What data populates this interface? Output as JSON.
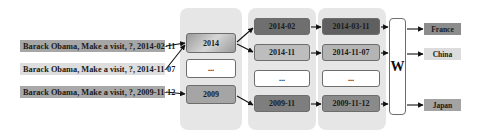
{
  "inputs": [
    {
      "label": "Barack Obama, Make a visit, ?, 2014-02-11",
      "color": "#a6a6a6"
    },
    {
      "label": "Barack Obama, Make a visit, ?, 2014-11-07",
      "color": "#dedede"
    },
    {
      "label": "Barack Obama, Make a visit, ?, 2009-11-12",
      "color": "#a9a9a9"
    }
  ],
  "year_level": [
    {
      "label": "2014",
      "color": "#a8a8a8"
    },
    {
      "label": "...",
      "color": "#ffffff"
    },
    {
      "label": "2009",
      "color": "#a5a5a5"
    }
  ],
  "month_level": [
    {
      "label": "2014-02",
      "color": "#6f6f6f"
    },
    {
      "label": "2014-11",
      "color": "#bdbdbd"
    },
    {
      "label": "...",
      "color": "#ffffff"
    },
    {
      "label": "2009-11",
      "color": "#7e7e7e"
    }
  ],
  "day_level": [
    {
      "label": "2014-03-11",
      "color": "#5f5f5f"
    },
    {
      "label": "2014-11-07",
      "color": "#b4b4b4"
    },
    {
      "label": "...",
      "color": "#ffffff"
    },
    {
      "label": "2009-11-12",
      "color": "#8a8a8a"
    }
  ],
  "weight": {
    "label": "W"
  },
  "outputs": [
    {
      "label": "France",
      "color": "#8c8c8c"
    },
    {
      "label": "China",
      "color": "#dcdcdc"
    },
    {
      "label": "Japan",
      "color": "#a3a3a3"
    }
  ]
}
